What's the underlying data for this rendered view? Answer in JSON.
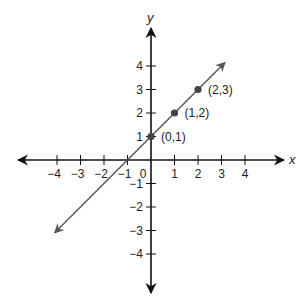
{
  "chart_data": {
    "type": "line",
    "title": "",
    "xlabel": "x",
    "ylabel": "y",
    "xlim": [
      -4.5,
      5.5
    ],
    "ylim": [
      -5.7,
      5.6
    ],
    "grid": false,
    "x_ticks": [
      -4,
      -3,
      -2,
      -1,
      0,
      1,
      2,
      3,
      4
    ],
    "y_ticks": [
      -4,
      -3,
      -2,
      -1,
      1,
      2,
      3,
      4
    ],
    "x_tick_labels": [
      "−4",
      "−3",
      "−2",
      "−1",
      "0",
      "1",
      "2",
      "3",
      "4"
    ],
    "y_tick_labels": [
      "−4",
      "−3",
      "−2",
      "−1",
      "1",
      "2",
      "3",
      "4"
    ],
    "series": [
      {
        "name": "y = x + 1",
        "equation": "y = x + 1",
        "x": [
          -4.1,
          3.15
        ],
        "y": [
          -3.1,
          4.15
        ],
        "arrows": "both"
      }
    ],
    "points": [
      {
        "x": 0,
        "y": 1,
        "label": "(0,1)"
      },
      {
        "x": 1,
        "y": 2,
        "label": "(1,2)"
      },
      {
        "x": 2,
        "y": 3,
        "label": "(2,3)"
      }
    ],
    "colors": {
      "axis": "#111111",
      "line": "#555555",
      "point": "#444444"
    }
  }
}
